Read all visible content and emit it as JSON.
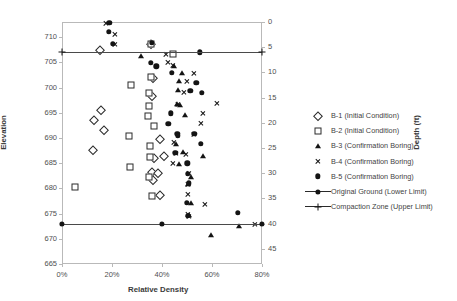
{
  "chart_data": {
    "type": "scatter",
    "title": "",
    "xlabel": "Relative Density",
    "ylabel": "Elevation",
    "y2label": "Depth (ft)",
    "xlim": [
      0,
      80
    ],
    "ylim": [
      665,
      713
    ],
    "y2lim": [
      0,
      48
    ],
    "grid": false,
    "legend_position": "right",
    "xticks": [
      "0%",
      "20%",
      "40%",
      "60%",
      "80%"
    ],
    "xtick_values": [
      0,
      20,
      40,
      60,
      80
    ],
    "yticks": [
      "665",
      "670",
      "675",
      "680",
      "685",
      "690",
      "695",
      "700",
      "705",
      "710"
    ],
    "ytick_values": [
      665,
      670,
      675,
      680,
      685,
      690,
      695,
      700,
      705,
      710
    ],
    "y2ticks": [
      "0",
      "5",
      "10",
      "15",
      "20",
      "25",
      "30",
      "35",
      "40",
      "45"
    ],
    "y2tick_values": [
      0,
      5,
      10,
      15,
      20,
      25,
      30,
      35,
      40,
      45
    ],
    "series": [
      {
        "name": "B-1 (Initial Condition)",
        "marker": "open-diamond",
        "points": [
          [
            15.3,
            707.4
          ],
          [
            15.6,
            695.6
          ],
          [
            12.8,
            693.5
          ],
          [
            16.8,
            691.6
          ],
          [
            12.4,
            687.6
          ],
          [
            35.6,
            708.6
          ],
          [
            36.2,
            701.9
          ],
          [
            36.0,
            698.3
          ],
          [
            39.0,
            689.7
          ],
          [
            36.8,
            686.0
          ],
          [
            36.1,
            683.3
          ],
          [
            38.2,
            683.0
          ],
          [
            36.5,
            681.6
          ],
          [
            40.6,
            686.4
          ],
          [
            39.3,
            678.6
          ]
        ]
      },
      {
        "name": "B-2 (Initial Condition)",
        "marker": "open-square",
        "points": [
          [
            35.7,
            708.7
          ],
          [
            27.4,
            700.6
          ],
          [
            35.6,
            702.1
          ],
          [
            34.9,
            699.0
          ],
          [
            34.6,
            696.4
          ],
          [
            34.3,
            694.3
          ],
          [
            26.9,
            690.4
          ],
          [
            27.0,
            684.3
          ],
          [
            36.9,
            692.3
          ],
          [
            35.2,
            688.4
          ],
          [
            35.0,
            686.3
          ],
          [
            34.8,
            682.3
          ],
          [
            5.2,
            680.3
          ],
          [
            36.0,
            678.5
          ],
          [
            44.5,
            706.6
          ]
        ]
      },
      {
        "name": "B-3 (Confirmation Boring)",
        "marker": "filled-triangle",
        "points": [
          [
            31.4,
            706.3
          ],
          [
            44.9,
            704.3
          ],
          [
            47.8,
            702.9
          ],
          [
            46.8,
            701.3
          ],
          [
            46.5,
            699.5
          ],
          [
            45.9,
            696.8
          ],
          [
            49.2,
            694.5
          ],
          [
            45.6,
            688.9
          ],
          [
            48.2,
            687.2
          ],
          [
            46.6,
            684.9
          ],
          [
            51.5,
            682.3
          ],
          [
            50.2,
            680.9
          ],
          [
            51.4,
            677.1
          ],
          [
            50.6,
            674.8
          ],
          [
            56.3,
            686.5
          ],
          [
            70.8,
            672.6
          ],
          [
            59.4,
            670.7
          ],
          [
            47.0,
            696.6
          ]
        ]
      },
      {
        "name": "B-4 (Confirmation Boring)",
        "marker": "x-cross",
        "points": [
          [
            17.6,
            712.8
          ],
          [
            21.2,
            710.6
          ],
          [
            21.0,
            708.6
          ],
          [
            41.4,
            706.6
          ],
          [
            42.5,
            705.1
          ],
          [
            44.3,
            704.4
          ],
          [
            52.8,
            702.9
          ],
          [
            50.1,
            701.2
          ],
          [
            48.9,
            699.0
          ],
          [
            62.1,
            696.8
          ],
          [
            46.5,
            696.6
          ],
          [
            56.4,
            694.9
          ],
          [
            55.6,
            692.9
          ],
          [
            44.8,
            689.1
          ],
          [
            52.6,
            690.8
          ],
          [
            45.5,
            686.9
          ],
          [
            49.6,
            686.8
          ],
          [
            44.2,
            684.9
          ],
          [
            50.9,
            682.9
          ],
          [
            50.4,
            680.9
          ],
          [
            50.2,
            678.9
          ],
          [
            57.0,
            676.9
          ],
          [
            50.2,
            674.8
          ],
          [
            50.6,
            674.5
          ],
          [
            77.0,
            672.8
          ]
        ]
      },
      {
        "name": "B-5 (Confirmation Boring)",
        "marker": "filled-circle",
        "points": [
          [
            18.9,
            712.9
          ],
          [
            18.8,
            711.1
          ],
          [
            20.4,
            708.7
          ],
          [
            35.9,
            708.9
          ],
          [
            55.2,
            707.0
          ],
          [
            35.6,
            704.9
          ],
          [
            37.7,
            704.2
          ],
          [
            43.8,
            702.9
          ],
          [
            53.7,
            701.0
          ],
          [
            51.3,
            699.4
          ],
          [
            55.9,
            698.9
          ],
          [
            43.5,
            694.9
          ],
          [
            42.5,
            692.8
          ],
          [
            46.1,
            690.8
          ],
          [
            46.4,
            690.4
          ],
          [
            52.9,
            690.8
          ],
          [
            55.5,
            688.9
          ],
          [
            45.3,
            687.0
          ],
          [
            50.1,
            685.0
          ],
          [
            50.4,
            682.9
          ],
          [
            50.8,
            681.0
          ],
          [
            49.8,
            677.1
          ],
          [
            70.2,
            675.1
          ],
          [
            50.3,
            674.6
          ]
        ]
      }
    ],
    "reference_lines": [
      {
        "name": "Compaction Zone (Upper Limit)",
        "marker": "plus",
        "elevation": 707.0,
        "depth": 6,
        "x_from": 0,
        "x_to": 80,
        "nodes": [
          0,
          80
        ]
      },
      {
        "name": "Original Ground (Lower Limit)",
        "marker": "filled-circle",
        "elevation": 673.0,
        "depth": 40,
        "x_from": 0,
        "x_to": 80,
        "nodes": [
          0,
          40,
          80
        ]
      }
    ]
  },
  "legend": {
    "items": [
      {
        "label": "B-1 (Initial Condition)",
        "key": "open-diamond",
        "type": "marker"
      },
      {
        "label": "B-2 (Initial Condition)",
        "key": "open-square",
        "type": "marker"
      },
      {
        "label": "B-3 (Confirmation Boring)",
        "key": "filled-triangle",
        "type": "marker"
      },
      {
        "label": "B-4 (Confirmation Boring)",
        "key": "x-cross",
        "type": "marker"
      },
      {
        "label": "B-5 (Confirmation Boring)",
        "key": "filled-circle",
        "type": "marker"
      },
      {
        "label": "Original Ground (Lower Limit)",
        "key": "filled-circle",
        "type": "line"
      },
      {
        "label": "Compaction Zone (Upper Limit)",
        "key": "plus",
        "type": "line"
      }
    ]
  },
  "colors": {
    "marker": "#141414",
    "axis": "#b9b9b9",
    "text": "#4a4a4a",
    "refline": "#4a4a4a",
    "background": "#ffffff"
  }
}
